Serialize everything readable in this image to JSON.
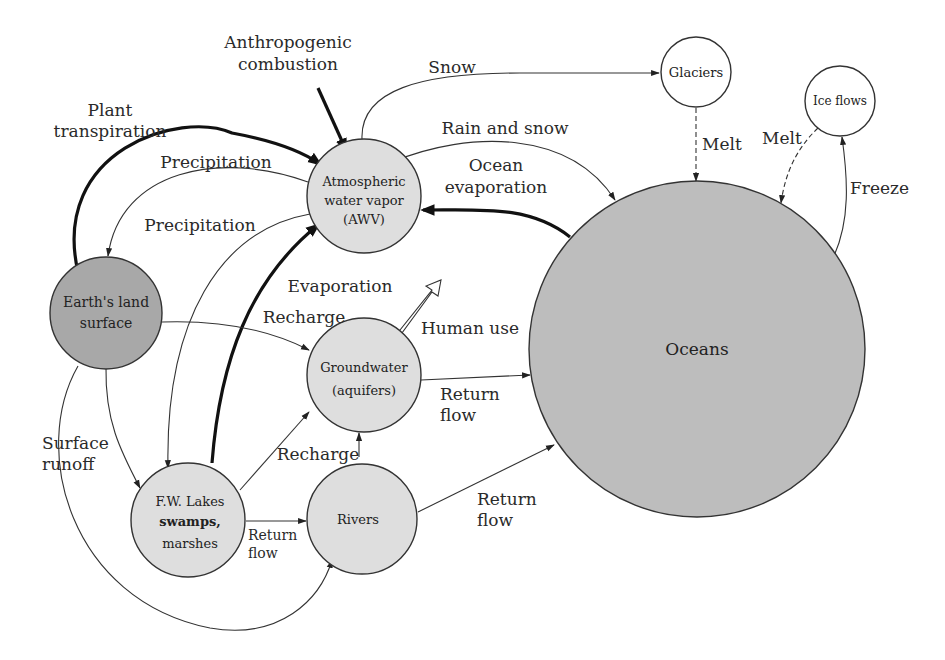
{
  "colors": {
    "land_fill": "#a8a8a8",
    "light_node_fill": "#dedede",
    "ocean_fill": "#bdbdbd",
    "ice_node_fill": "#ffffff",
    "stroke": "#333333"
  },
  "nodes": {
    "awv": {
      "line1": "Atmospheric",
      "line2": "water vapor",
      "line3": "(AWV)"
    },
    "land": {
      "line1": "Earth's land",
      "line2": "surface"
    },
    "groundwater": {
      "line1": "Groundwater",
      "line2": "(aquifers)"
    },
    "lakes": {
      "line1": "F.W. Lakes",
      "line2": "swamps,",
      "line3": "marshes"
    },
    "rivers": {
      "label": "Rivers"
    },
    "oceans": {
      "label": "Oceans"
    },
    "glaciers": {
      "label": "Glaciers"
    },
    "ice_flows": {
      "label": "Ice flows"
    }
  },
  "flows": {
    "anthropogenic": {
      "line1": "Anthropogenic",
      "line2": "combustion"
    },
    "plant_transpiration": {
      "line1": "Plant",
      "line2": "transpiration"
    },
    "precipitation_land": "Precipitation",
    "precipitation_lakes": "Precipitation",
    "snow": "Snow",
    "rain_and_snow": "Rain and snow",
    "ocean_evaporation": {
      "line1": "Ocean",
      "line2": "evaporation"
    },
    "glacier_melt": "Melt",
    "ice_melt": "Melt",
    "freeze": "Freeze",
    "evaporation": "Evaporation",
    "recharge_land": "Recharge",
    "human_use": "Human use",
    "gw_return": {
      "line1": "Return",
      "line2": "flow"
    },
    "surface_runoff": {
      "line1": "Surface",
      "line2": "runoff"
    },
    "recharge_lakes": "Recharge",
    "lakes_return": {
      "line1": "Return",
      "line2": "flow"
    },
    "rivers_return": {
      "line1": "Return",
      "line2": "flow"
    }
  }
}
